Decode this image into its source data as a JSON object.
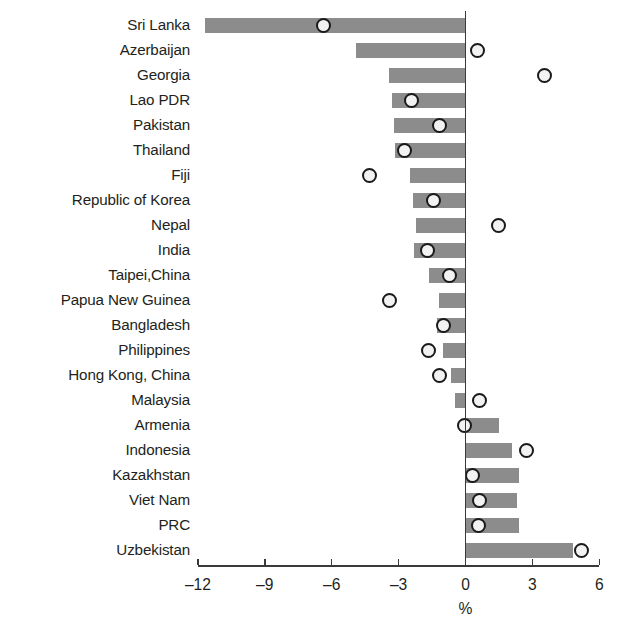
{
  "chart_data": {
    "type": "bar",
    "title": "",
    "subtitle": "",
    "xlabel": "%",
    "ylabel": "",
    "xlim": [
      -12.6,
      6.6
    ],
    "xticks": [
      -12,
      -9,
      -6,
      -3,
      0,
      3,
      6
    ],
    "xticklabels": [
      "–12",
      "–9",
      "–6",
      "–3",
      "0",
      "3",
      "6"
    ],
    "grid": false,
    "legend": null,
    "orientation": "horizontal",
    "bar_color": "#8c8c8c",
    "marker_color": "#f2f2f2",
    "marker_edge_color": "#1a1a1a",
    "categories": [
      "Sri Lanka",
      "Azerbaijan",
      "Georgia",
      "Lao PDR",
      "Pakistan",
      "Thailand",
      "Fiji",
      "Republic of Korea",
      "Nepal",
      "India",
      "Taipei,China",
      "Papua New Guinea",
      "Bangladesh",
      "Philippines",
      "Hong Kong, China",
      "Malaysia",
      "Armenia",
      "Indonesia",
      "Kazakhstan",
      "Viet Nam",
      "PRC",
      "Uzbekistan"
    ],
    "series": [
      {
        "name": "bar",
        "type": "bar",
        "values": [
          -11.7,
          -4.9,
          -3.45,
          -3.3,
          -3.2,
          -3.15,
          -2.5,
          -2.35,
          -2.2,
          -2.3,
          -1.65,
          -1.2,
          -1.3,
          -1.0,
          -0.65,
          -0.45,
          1.5,
          2.1,
          2.4,
          2.3,
          2.4,
          4.8
        ]
      },
      {
        "name": "marker",
        "type": "scatter",
        "values": [
          -6.35,
          0.55,
          3.55,
          -2.4,
          -1.15,
          -2.75,
          -4.3,
          -1.45,
          1.5,
          -1.7,
          -0.7,
          -3.4,
          -1.0,
          -1.65,
          -1.15,
          0.65,
          -0.05,
          2.75,
          0.3,
          0.65,
          0.6,
          5.2
        ]
      }
    ]
  },
  "axis": {
    "unit_label": "%"
  }
}
